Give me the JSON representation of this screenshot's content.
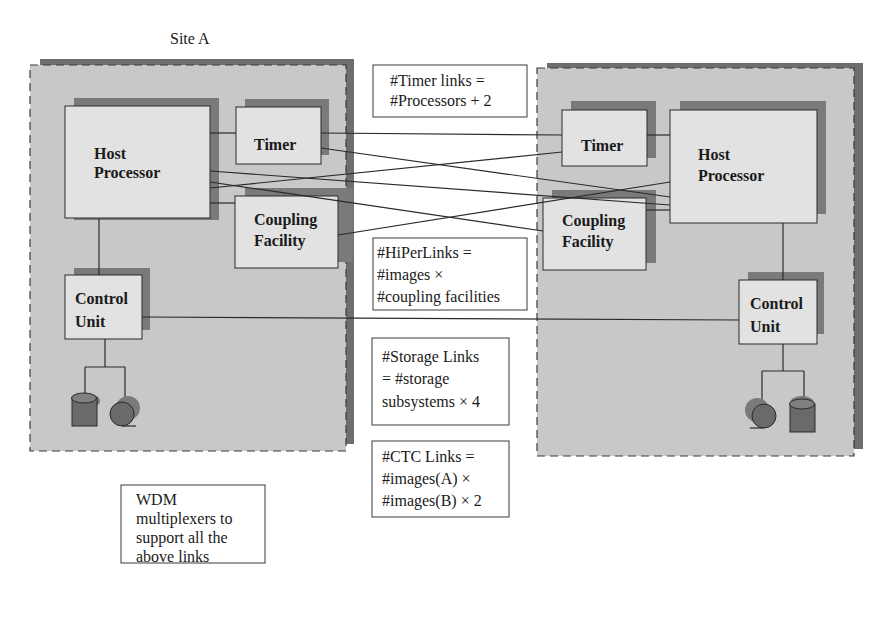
{
  "sites": [
    {
      "title": "Site A",
      "components": {
        "host_processor": [
          "Host",
          "Processor"
        ],
        "timer": "Timer",
        "coupling_facility": [
          "Coupling",
          "Facility"
        ],
        "control_unit": [
          "Control",
          "Unit"
        ]
      },
      "storage_devices": [
        "disk",
        "tape"
      ]
    },
    {
      "title": "Site B",
      "components": {
        "host_processor": [
          "Host",
          "Processor"
        ],
        "timer": "Timer",
        "coupling_facility": [
          "Coupling",
          "Facility"
        ],
        "control_unit": [
          "Control",
          "Unit"
        ]
      },
      "storage_devices": [
        "tape",
        "disk"
      ]
    }
  ],
  "notes": {
    "timer_links": [
      "#Timer links =",
      "#Processors + 2"
    ],
    "hiperlinks": [
      "#HiPerLinks =",
      "#images ×",
      "#coupling facilities"
    ],
    "storage_links": [
      "#Storage Links",
      "= #storage",
      "subsystems × 4"
    ],
    "ctc_links": [
      "#CTC Links =",
      "#images(A) ×",
      "#images(B) × 2"
    ],
    "wdm": [
      "WDM",
      "multiplexers to",
      "support all the",
      "above links"
    ]
  },
  "colors": {
    "site_fill": "#c8c8c8",
    "site_shadow": "#6e6e6e",
    "box_fill": "#e2e2e2",
    "box_shadow": "#7a7a7a",
    "line": "#2a2a2a"
  }
}
